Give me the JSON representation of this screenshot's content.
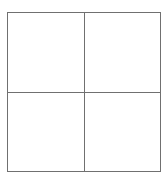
{
  "diagram": {
    "type": "grid",
    "rows": 2,
    "columns": 2,
    "cells": [
      {
        "row": 0,
        "col": 0,
        "text": ""
      },
      {
        "row": 0,
        "col": 1,
        "text": ""
      },
      {
        "row": 1,
        "col": 0,
        "text": ""
      },
      {
        "row": 1,
        "col": 1,
        "text": ""
      }
    ],
    "line_color": "#707070",
    "background": "#ffffff"
  }
}
